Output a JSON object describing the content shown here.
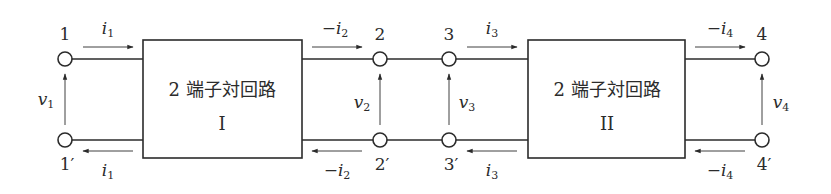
{
  "figure": {
    "type": "cascade connection of two 2-port networks",
    "stroke_color": "#2b2b2b",
    "background": "#ffffff"
  },
  "networks": [
    {
      "id": "I",
      "title": "2 端子対回路",
      "roman": "I"
    },
    {
      "id": "II",
      "title": "2 端子対回路",
      "roman": "II"
    }
  ],
  "terminals": {
    "t1": "1",
    "t1p": "1′",
    "t2": "2",
    "t2p": "2′",
    "t3": "3",
    "t3p": "3′",
    "t4": "4",
    "t4p": "4′"
  },
  "currents": {
    "i1_top": {
      "sign": "",
      "sym": "i",
      "sub": "1",
      "direction": "right"
    },
    "i1_bot": {
      "sign": "",
      "sym": "i",
      "sub": "1",
      "direction": "left"
    },
    "i2_top": {
      "sign": "−",
      "sym": "i",
      "sub": "2",
      "direction": "right"
    },
    "i2_bot": {
      "sign": "−",
      "sym": "i",
      "sub": "2",
      "direction": "left"
    },
    "i3_top": {
      "sign": "",
      "sym": "i",
      "sub": "3",
      "direction": "right"
    },
    "i3_bot": {
      "sign": "",
      "sym": "i",
      "sub": "3",
      "direction": "left"
    },
    "i4_top": {
      "sign": "−",
      "sym": "i",
      "sub": "4",
      "direction": "right"
    },
    "i4_bot": {
      "sign": "−",
      "sym": "i",
      "sub": "4",
      "direction": "left"
    }
  },
  "voltages": {
    "v1": {
      "sym": "v",
      "sub": "1",
      "direction": "up"
    },
    "v2": {
      "sym": "v",
      "sub": "2",
      "direction": "up"
    },
    "v3": {
      "sym": "v",
      "sub": "3",
      "direction": "up"
    },
    "v4": {
      "sym": "v",
      "sub": "4",
      "direction": "up"
    }
  }
}
